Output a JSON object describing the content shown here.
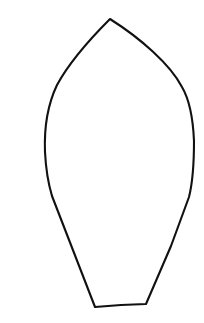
{
  "document": {
    "title": "Leaf Petal Outline Template",
    "background_color": "#ffffff",
    "canvas": {
      "width": 204,
      "height": 323
    }
  },
  "artwork": {
    "name": "leaf-outline",
    "description": "Black line-art outline of a leaf or flower petal with a pointed apex and a flat truncated base",
    "style": {
      "stroke_color": "#111111",
      "stroke_width": 2.1,
      "fill": "none"
    },
    "geometry": {
      "apex": {
        "x": 110,
        "y": 19
      },
      "leftmost": {
        "x": 45,
        "y": 152
      },
      "rightmost": {
        "x": 194,
        "y": 141
      },
      "base_left": {
        "x": 95,
        "y": 307
      },
      "base_right": {
        "x": 146,
        "y": 304
      },
      "path": "M 110 19 C 92 37 70 61 57 85 C 47 106 44 127 45 152 C 46 172 49 186 52 196 L 95 307 L 121 305 L 146 304 L 171 246 L 189 197 C 192 185 194 163 194 141 C 193 117 189 99 182 87 C 170 64 140 38 110 19 Z"
    }
  }
}
